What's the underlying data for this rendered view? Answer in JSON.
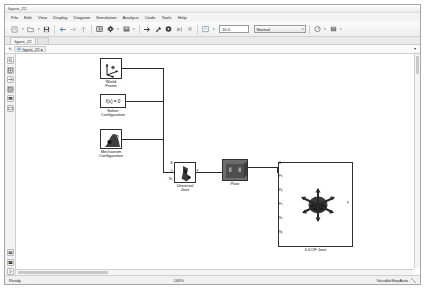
{
  "window": {
    "title": "figure_22"
  },
  "menubar": {
    "items": [
      {
        "label": "File"
      },
      {
        "label": "Edit"
      },
      {
        "label": "View"
      },
      {
        "label": "Display"
      },
      {
        "label": "Diagram"
      },
      {
        "label": "Simulation"
      },
      {
        "label": "Analysis"
      },
      {
        "label": "Code"
      },
      {
        "label": "Tools"
      },
      {
        "label": "Help"
      }
    ]
  },
  "toolbar": {
    "buttons": [
      {
        "name": "new-model-button",
        "icon": "new-model-icon",
        "has_caret": true
      },
      {
        "name": "open-model-button",
        "icon": "folder-open-icon",
        "has_caret": true
      },
      {
        "name": "save-button",
        "icon": "save-disk-icon",
        "has_caret": false
      },
      {
        "name": "back-button",
        "icon": "arrow-left-icon",
        "has_caret": false
      },
      {
        "name": "forward-button",
        "icon": "arrow-right-icon",
        "has_caret": false
      },
      {
        "name": "up-to-parent-button",
        "icon": "arrow-up-icon",
        "has_caret": false
      },
      {
        "name": "library-browser-button",
        "icon": "library-icon",
        "has_caret": false
      },
      {
        "name": "model-configuration-button",
        "icon": "gear-icon",
        "has_caret": true
      },
      {
        "name": "model-explorer-button",
        "icon": "explorer-icon",
        "has_caret": true
      },
      {
        "name": "update-diagram-button",
        "icon": "update-arrow-icon",
        "has_caret": false
      },
      {
        "name": "build-button",
        "icon": "hammer-icon",
        "has_caret": false
      },
      {
        "name": "run-button",
        "icon": "play-circle-icon",
        "has_caret": false
      },
      {
        "name": "step-forward-button",
        "icon": "step-forward-icon",
        "has_caret": false
      },
      {
        "name": "stop-button",
        "icon": "stop-icon",
        "has_caret": false
      },
      {
        "name": "fast-restart-button",
        "icon": "fast-restart-icon",
        "has_caret": true
      }
    ],
    "simulation_time": {
      "label": "simulation-stop-time",
      "value": "10.0"
    },
    "simulation_mode": {
      "value": "Normal",
      "caret": "▾"
    },
    "right_buttons": [
      {
        "name": "performance-advisor-button",
        "icon": "performance-icon",
        "has_caret": true
      },
      {
        "name": "model-advisor-button",
        "icon": "model-advisor-icon",
        "has_caret": true
      }
    ]
  },
  "tabstrip": {
    "tabs": [
      {
        "label": "figure_22",
        "active": true
      }
    ]
  },
  "breadcrumb": {
    "back_glyph": "↰",
    "icon": "model-icon",
    "label": "figure_22",
    "pin_glyph": "▸",
    "caret": "▾"
  },
  "palette": {
    "top_tools": [
      {
        "name": "zoom-in-tool",
        "icon": "magnifier-icon"
      },
      {
        "name": "fit-to-view-tool",
        "icon": "fit-view-icon"
      },
      {
        "name": "pan-tool",
        "icon": "arrow-pointer-icon"
      },
      {
        "name": "grid-tool",
        "icon": "grid-icon"
      },
      {
        "name": "image-tool",
        "icon": "image-icon"
      },
      {
        "name": "annotation-tool",
        "icon": "rectangle-icon"
      }
    ],
    "bottom_tools": [
      {
        "name": "signal-table-tool",
        "icon": "table-icon"
      },
      {
        "name": "scope-tool",
        "icon": "scope-icon"
      },
      {
        "name": "expand-tool",
        "icon": "chevron-right-icon"
      }
    ]
  },
  "canvas": {
    "blocks": [
      {
        "name": "world-frame-block",
        "label": "World\nFrame",
        "label_line1": "World",
        "label_line2": "Frame",
        "icon": "world-frame-icon",
        "x": 84,
        "y": 4,
        "w": 22,
        "h": 21,
        "ports": [
          {
            "id": "W",
            "side": "right"
          }
        ]
      },
      {
        "name": "solver-configuration-block",
        "label": "Solver\nConfiguration",
        "label_line1": "Solver",
        "label_line2": "Configuration",
        "icon": "solver-icon",
        "glyph": "f(x) = 0",
        "x": 84,
        "y": 40,
        "w": 26,
        "h": 14,
        "ports": [
          {
            "id": "S",
            "side": "right"
          }
        ]
      },
      {
        "name": "mechanism-configuration-block",
        "label": "Mechanism\nConfiguration",
        "label_line1": "Mechanism",
        "label_line2": "Configuration",
        "icon": "gravity-icon",
        "x": 84,
        "y": 75,
        "w": 22,
        "h": 20,
        "ports": [
          {
            "id": "M",
            "side": "right"
          }
        ]
      },
      {
        "name": "universal-joint-block",
        "label": "Universal\nJoint",
        "label_line1": "Universal",
        "label_line2": "Joint",
        "icon": "universal-joint-icon",
        "x": 158,
        "y": 108,
        "w": 22,
        "h": 21,
        "ports": [
          {
            "id": "B",
            "side": "left"
          },
          {
            "id": "Q",
            "side": "left"
          },
          {
            "id": "Rz",
            "side": "left"
          },
          {
            "id": "F",
            "side": "right"
          }
        ]
      },
      {
        "name": "plate-block",
        "label": "Plate",
        "label_line1": "Plate",
        "icon": "solid-brick-icon",
        "x": 206,
        "y": 105,
        "w": 26,
        "h": 22,
        "ports": [
          {
            "id": "R",
            "side": "left"
          },
          {
            "id": "L",
            "side": "right"
          }
        ]
      },
      {
        "name": "six-dof-joint-block",
        "label": "6-DOF Joint",
        "label_line1": "6-DOF Joint",
        "icon": "six-dof-joint-icon",
        "x": 262,
        "y": 108,
        "w": 75,
        "h": 85,
        "ports": [
          {
            "id": "B",
            "side": "left"
          },
          {
            "id": "Px",
            "side": "left"
          },
          {
            "id": "Py",
            "side": "left"
          },
          {
            "id": "Pz",
            "side": "left"
          },
          {
            "id": "Rx",
            "side": "left"
          },
          {
            "id": "Ry",
            "side": "left"
          },
          {
            "id": "F",
            "side": "right"
          }
        ]
      }
    ]
  },
  "statusbar": {
    "status": "Ready",
    "zoom": "140%",
    "solver": "VariableStepAuto"
  }
}
